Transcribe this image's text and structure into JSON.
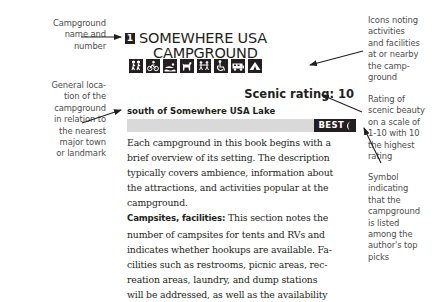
{
  "annotations": {
    "name": {
      "lines": [
        "Campground",
        "name and",
        "number"
      ]
    },
    "location": {
      "lines": [
        "General loca-",
        "tion of the",
        "campground",
        "in relation to",
        "the nearest",
        "major town",
        "or landmark"
      ]
    },
    "icons": {
      "lines": [
        "Icons noting",
        "activities",
        "and facilities",
        "at or nearby",
        "the camp-",
        "ground"
      ]
    },
    "rating": {
      "lines": [
        "Rating of",
        "scenic beauty",
        "on a scale of",
        "1-10 with 10",
        "the highest",
        "rating"
      ]
    },
    "best": {
      "lines": [
        "Symbol",
        "indicating",
        "that the",
        "campground",
        "is listed",
        "among the",
        "author's top",
        "picks"
      ]
    }
  },
  "campground": {
    "number": "1",
    "title_line1": "SOMEWHERE USA",
    "title_line2": "CAMPGROUND",
    "icons": [
      "hiking-icon",
      "biking-icon",
      "swimming-icon",
      "pets-icon",
      "playground-icon",
      "wheelchair-icon",
      "rv-icon",
      "tent-icon"
    ],
    "scenic_rating_label": "Scenic rating: 10",
    "location": "south of Somewhere USA Lake",
    "best_label": "BEST",
    "body_lines": [
      "Each campground in this book begins with a",
      "brief overview of its setting. The description",
      "typically covers ambience, information about",
      "the attractions, and activities popular at the",
      "campground."
    ],
    "campsites_lead": "Campsites, facilities:",
    "campsites_first": " This section notes the",
    "campsites_lines": [
      "number of campsites for tents and RVs and",
      "indicates whether hookups are available. Fa-",
      "cilities such as restrooms, picnic areas, rec-",
      "reation areas, laundry, and dump stations",
      "will be addressed, as well as the availability"
    ]
  }
}
